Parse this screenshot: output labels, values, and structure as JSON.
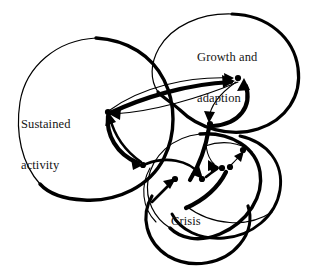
{
  "diagram": {
    "type": "causal-loop-network",
    "background_color": "#ffffff",
    "stroke_color": "#000000",
    "domains": [
      {
        "id": "sustained-activity",
        "label": "Sustained\nactivity",
        "label_line1": "Sustained",
        "label_line2": "activity",
        "cx": 96,
        "cy": 124,
        "rx": 80,
        "ry": 68,
        "rotation": -18
      },
      {
        "id": "growth-and-adaption",
        "label": "Growth and\nadaption",
        "label_line1": "Growth and",
        "label_line2": "adaption",
        "cx": 228,
        "cy": 72,
        "rx": 72,
        "ry": 58,
        "rotation": -12
      },
      {
        "id": "crisis",
        "label": "Crisis",
        "label_line1": "Crisis",
        "label_line2": "",
        "cx": 196,
        "cy": 186,
        "rx": 58,
        "ry": 52,
        "rotation": 8
      }
    ],
    "nodes": [
      {
        "id": "n1",
        "x": 108,
        "y": 112
      },
      {
        "id": "n2",
        "x": 143,
        "y": 165
      },
      {
        "id": "n3",
        "x": 238,
        "y": 78
      },
      {
        "id": "n4",
        "x": 210,
        "y": 124
      },
      {
        "id": "n5",
        "x": 222,
        "y": 168
      },
      {
        "id": "n6",
        "x": 230,
        "y": 167
      },
      {
        "id": "n7",
        "x": 243,
        "y": 150
      },
      {
        "id": "n8",
        "x": 175,
        "y": 179
      },
      {
        "id": "n9",
        "x": 202,
        "y": 179
      }
    ],
    "node_radius": 3.1,
    "links": [
      {
        "from": "n1",
        "to": "n3",
        "weight": "thin",
        "note": "sustained to growth upper"
      },
      {
        "from": "n1",
        "to": "n3",
        "weight": "thick",
        "note": "sustained to growth lower bold"
      },
      {
        "from": "n3",
        "to": "n1",
        "weight": "thin",
        "note": "growth back to sustained"
      },
      {
        "from": "n3",
        "to": "n4",
        "weight": "thin",
        "note": "growth down to mid-right"
      },
      {
        "from": "n4",
        "to": "n3",
        "weight": "thick",
        "note": "mid-right up to growth bold"
      },
      {
        "from": "n1",
        "to": "n2",
        "weight": "thick",
        "note": "sustained down bold"
      },
      {
        "from": "n2",
        "to": "n1",
        "weight": "med",
        "note": "return up to sustained"
      },
      {
        "from": "n2",
        "to": "n9",
        "weight": "med",
        "note": "left-mid to crisis right"
      },
      {
        "from": "n8",
        "to": "n2",
        "weight": "thin",
        "note": "crisis left to mid"
      },
      {
        "from": "n4",
        "to": "n5",
        "weight": "thin",
        "note": "mid-right down to crisis pair"
      },
      {
        "from": "n9",
        "to": "n5",
        "weight": "med",
        "note": "crisis right to pair"
      },
      {
        "from": "n7",
        "to": "n6",
        "weight": "thin",
        "note": "far right down-left"
      },
      {
        "from": "n6",
        "to": "n7",
        "weight": "thin",
        "note": "pair up to far right"
      }
    ],
    "label_positions": {
      "sustained": {
        "left": 21,
        "top": 91
      },
      "growth": {
        "left": 197,
        "top": 24
      },
      "crisis": {
        "left": 171,
        "top": 188
      }
    }
  }
}
